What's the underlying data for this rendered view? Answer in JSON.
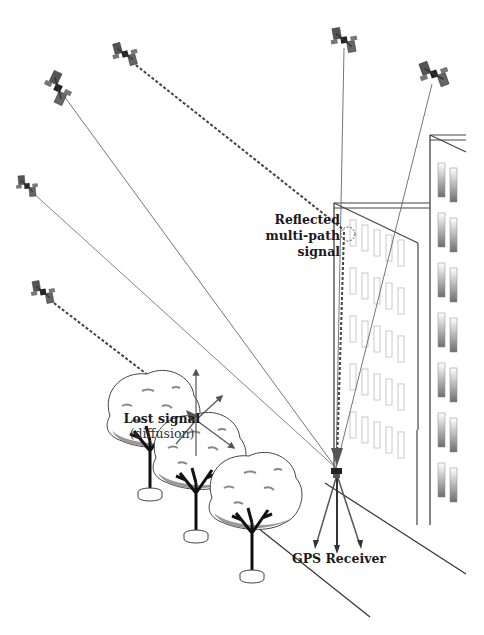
{
  "diagram": {
    "labels": {
      "reflected_line1": "Reflected",
      "reflected_line2": "multi-path",
      "reflected_line3": "signal",
      "lost_line1": "Lost signal",
      "lost_line2": "(diffusion)",
      "receiver": "GPS Receiver"
    },
    "colors": {
      "line": "#555555",
      "dashed": "#444444",
      "building": "#444444",
      "window_light": "#bbbbbb",
      "window_dark": "#777777",
      "foliage_shadow": "#999999"
    },
    "satellites": [
      {
        "id": "sat-1",
        "x": 58,
        "y": 88,
        "signal": "direct"
      },
      {
        "id": "sat-2",
        "x": 125,
        "y": 54,
        "signal": "reflected"
      },
      {
        "id": "sat-3",
        "x": 344,
        "y": 40,
        "signal": "direct"
      },
      {
        "id": "sat-4",
        "x": 434,
        "y": 74,
        "signal": "direct"
      },
      {
        "id": "sat-5",
        "x": 27,
        "y": 186,
        "signal": "direct"
      },
      {
        "id": "sat-6",
        "x": 43,
        "y": 292,
        "signal": "blocked"
      }
    ]
  }
}
